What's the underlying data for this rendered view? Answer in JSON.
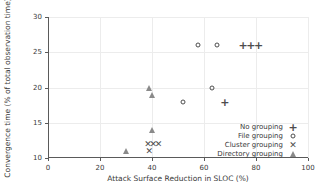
{
  "chart_data": {
    "type": "scatter",
    "title": "",
    "xlabel": "Attack Surface Reduction in SLOC (%)",
    "ylabel": "Convergence time (% of total observation time)",
    "xlim": [
      0,
      100
    ],
    "ylim": [
      10,
      30
    ],
    "xticks": [
      0,
      20,
      40,
      60,
      80,
      100
    ],
    "yticks": [
      10,
      15,
      20,
      25,
      30
    ],
    "xticklabels": [
      "0",
      "20",
      "40",
      "60",
      "80",
      "100"
    ],
    "yticklabels": [
      "10",
      "15",
      "20",
      "25",
      "30"
    ],
    "grid": true,
    "legend_position": "lower right",
    "series": [
      {
        "name": "No grouping",
        "marker": "plus",
        "glyph": "+",
        "color": "#4d4d4d",
        "points": [
          [
            68,
            18
          ],
          [
            75,
            26
          ],
          [
            78,
            26
          ],
          [
            81,
            26
          ]
        ]
      },
      {
        "name": "File grouping",
        "marker": "circle-open",
        "glyph": "○",
        "color": "#4d4d4d",
        "points": [
          [
            52,
            18
          ],
          [
            57.5,
            26
          ],
          [
            63,
            20
          ],
          [
            65,
            26
          ]
        ]
      },
      {
        "name": "Cluster grouping",
        "marker": "x",
        "glyph": "✕",
        "color": "#4d4d4d",
        "points": [
          [
            38.5,
            12
          ],
          [
            40.5,
            12
          ],
          [
            42.5,
            12
          ],
          [
            39,
            11
          ]
        ]
      },
      {
        "name": "Directory grouping",
        "marker": "triangle-up",
        "glyph": "▲",
        "color": "#8a8a8a",
        "points": [
          [
            30,
            11
          ],
          [
            39,
            20
          ],
          [
            40,
            19
          ],
          [
            40,
            14
          ]
        ]
      }
    ]
  },
  "legend": {
    "items": [
      {
        "label": "No grouping"
      },
      {
        "label": "File grouping"
      },
      {
        "label": "Cluster grouping"
      },
      {
        "label": "Directory grouping"
      }
    ]
  }
}
